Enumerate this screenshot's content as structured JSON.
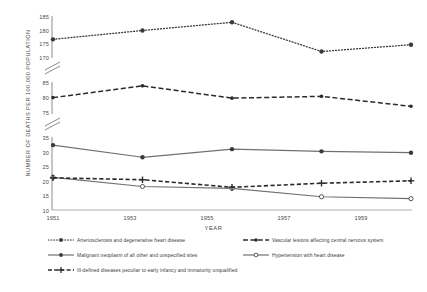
{
  "chart_data": {
    "type": "line",
    "title": "",
    "xlabel": "YEAR",
    "ylabel": "NUMBER OF DEATHS PER 100,000 POPULATION",
    "x": [
      1951,
      1953,
      1955,
      1957,
      1959
    ],
    "categories": [
      "1951",
      "1953",
      "1955",
      "1957",
      "1959"
    ],
    "axis_breaks": true,
    "grid": false,
    "legend_position": "bottom",
    "y_segments": [
      {
        "name": "upper",
        "ticks": [
          170,
          175,
          180,
          185
        ],
        "ylim": [
          168.5,
          186.5
        ]
      },
      {
        "name": "middle",
        "ticks": [
          75,
          80,
          85
        ],
        "ylim": [
          74.0,
          86.5
        ]
      },
      {
        "name": "lower",
        "ticks": [
          10,
          15,
          20,
          25,
          30,
          35
        ],
        "ylim": [
          9.0,
          36.0
        ]
      }
    ],
    "series": [
      {
        "name": "Arteriosclerosis and degenerative heart disease",
        "style": "dotted",
        "marker": "filled-circle",
        "segment": "upper",
        "values": [
          176.5,
          180.3,
          183.8,
          171.3,
          174.2
        ]
      },
      {
        "name": "Vascular lesions affecting central nervous system",
        "style": "dashed",
        "marker": "filled-small",
        "segment": "middle",
        "values": [
          80.4,
          85.0,
          80.2,
          80.9,
          77.0
        ]
      },
      {
        "name": "Malignant neoplasm of all other and unspecified sites",
        "style": "solid",
        "marker": "filled-circle",
        "segment": "lower",
        "values": [
          33.0,
          28.5,
          31.5,
          30.7,
          30.2
        ]
      },
      {
        "name": "Hypertension with heart disease",
        "style": "solid",
        "marker": "open-circle",
        "segment": "lower",
        "values": [
          21.1,
          17.7,
          17.0,
          13.9,
          13.2
        ]
      },
      {
        "name": "Ill-defined diseases peculiar to early infancy and immaturity unqualified",
        "style": "heavy-dashed",
        "marker": "plus",
        "segment": "lower",
        "values": [
          20.9,
          20.2,
          17.4,
          18.9,
          19.8
        ]
      }
    ]
  },
  "axis": {
    "y_title": "NUMBER OF DEATHS PER 100,000 POPULATION",
    "x_title": "YEAR",
    "y_ticks_upper": [
      "185",
      "180",
      "175",
      "170"
    ],
    "y_ticks_middle": [
      "85",
      "80",
      "75"
    ],
    "y_ticks_lower": [
      "35",
      "30",
      "25",
      "20",
      "15",
      "10"
    ],
    "x_ticks": [
      "1951",
      "1953",
      "1955",
      "1957",
      "1959"
    ]
  },
  "legend": {
    "items": [
      {
        "label": "Arteriosclerosis and degenerative heart disease",
        "icon": "dotted-line-filled-circle-marker"
      },
      {
        "label": "Vascular lesions affecting central nervous system",
        "icon": "dashed-line-filled-marker"
      },
      {
        "label": "Malignant neoplasm of all other and unspecified sites",
        "icon": "solid-line-filled-circle-marker"
      },
      {
        "label": "Hypertension with heart disease",
        "icon": "solid-line-open-circle-marker"
      },
      {
        "label": "Ill-defined diseases peculiar to early infancy and immaturity unqualified",
        "icon": "dashed-line-plus-marker"
      }
    ]
  },
  "colors": {
    "ink": "#3a3a3a",
    "axis": "#6e6e6e",
    "grey_line": "#707070",
    "dark_line": "#2b2b2b"
  }
}
